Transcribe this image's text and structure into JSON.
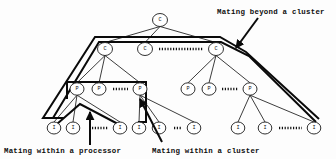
{
  "figure": {
    "width": 336,
    "height": 159,
    "background": "#fdfdfd",
    "line_color": "#1a1a1a",
    "thick_line_color": "#0a0a0a"
  },
  "annotations": {
    "beyond_cluster": "Mating beyond a cluster",
    "within_processor": "Mating within a processor",
    "within_cluster": "Mating within a cluster"
  },
  "node_labels": {
    "cluster": "C",
    "processor": "P",
    "individual": "I"
  },
  "nodes": [
    {
      "id": "root",
      "label": "C",
      "x": 160,
      "y": 20,
      "rx": 7.5,
      "ry": 6.5,
      "level": "root"
    },
    {
      "id": "c1",
      "label": "C",
      "x": 105,
      "y": 49,
      "rx": 7.5,
      "ry": 6.5,
      "level": "cluster"
    },
    {
      "id": "c2",
      "label": "C",
      "x": 145,
      "y": 49,
      "rx": 7.5,
      "ry": 6.5,
      "level": "cluster"
    },
    {
      "id": "c3",
      "label": "C",
      "x": 216,
      "y": 49,
      "rx": 7.5,
      "ry": 6.5,
      "level": "cluster"
    },
    {
      "id": "p1",
      "label": "P",
      "x": 77,
      "y": 89,
      "rx": 7.0,
      "ry": 6.2,
      "level": "processor"
    },
    {
      "id": "p2",
      "label": "P",
      "x": 99,
      "y": 89,
      "rx": 7.0,
      "ry": 6.2,
      "level": "processor"
    },
    {
      "id": "p3",
      "label": "P",
      "x": 140,
      "y": 89,
      "rx": 7.0,
      "ry": 6.2,
      "level": "processor"
    },
    {
      "id": "p4",
      "label": "P",
      "x": 188,
      "y": 89,
      "rx": 7.0,
      "ry": 6.2,
      "level": "processor"
    },
    {
      "id": "p5",
      "label": "P",
      "x": 209,
      "y": 89,
      "rx": 7.0,
      "ry": 6.2,
      "level": "processor"
    },
    {
      "id": "p6",
      "label": "P",
      "x": 250,
      "y": 89,
      "rx": 7.0,
      "ry": 6.2,
      "level": "processor"
    },
    {
      "id": "i1",
      "label": "I",
      "x": 54,
      "y": 128,
      "rx": 6.8,
      "ry": 6.0,
      "level": "individual"
    },
    {
      "id": "i2",
      "label": "I",
      "x": 73,
      "y": 128,
      "rx": 6.8,
      "ry": 6.0,
      "level": "individual"
    },
    {
      "id": "i3",
      "label": "I",
      "x": 120,
      "y": 128,
      "rx": 6.8,
      "ry": 6.0,
      "level": "individual"
    },
    {
      "id": "i4",
      "label": "I",
      "x": 139,
      "y": 128,
      "rx": 6.8,
      "ry": 6.0,
      "level": "individual"
    },
    {
      "id": "i5",
      "label": "I",
      "x": 159,
      "y": 128,
      "rx": 6.8,
      "ry": 6.0,
      "level": "individual"
    },
    {
      "id": "i6",
      "label": "I",
      "x": 194,
      "y": 128,
      "rx": 6.8,
      "ry": 6.0,
      "level": "individual"
    },
    {
      "id": "i7",
      "label": "I",
      "x": 238,
      "y": 128,
      "rx": 6.8,
      "ry": 6.0,
      "level": "individual"
    },
    {
      "id": "i8",
      "label": "I",
      "x": 265,
      "y": 128,
      "rx": 6.8,
      "ry": 6.0,
      "level": "individual"
    },
    {
      "id": "i9",
      "label": "I",
      "x": 314,
      "y": 128,
      "rx": 6.8,
      "ry": 6.0,
      "level": "individual"
    }
  ],
  "edges": [
    {
      "from": "root",
      "to": "c1"
    },
    {
      "from": "root",
      "to": "c2"
    },
    {
      "from": "root",
      "to": "c3"
    },
    {
      "from": "c1",
      "to": "p1"
    },
    {
      "from": "c1",
      "to": "p2"
    },
    {
      "from": "c1",
      "to": "p3"
    },
    {
      "from": "c3",
      "to": "p4"
    },
    {
      "from": "c3",
      "to": "p5"
    },
    {
      "from": "c3",
      "to": "p6"
    },
    {
      "from": "p1",
      "to": "i1"
    },
    {
      "from": "p1",
      "to": "i2"
    },
    {
      "from": "p1",
      "to": "i3"
    },
    {
      "from": "p3",
      "to": "i4"
    },
    {
      "from": "p3",
      "to": "i5"
    },
    {
      "from": "p3",
      "to": "i6"
    },
    {
      "from": "p6",
      "to": "i7"
    },
    {
      "from": "p6",
      "to": "i8"
    },
    {
      "from": "p6",
      "to": "i9"
    }
  ],
  "ellipsis_marks": [
    {
      "id": "cluster-row-dots",
      "x1": 159,
      "x2": 203,
      "y": 49
    },
    {
      "id": "processor-left-dots",
      "x1": 113,
      "x2": 128,
      "y": 89
    },
    {
      "id": "processor-right-dots",
      "x1": 222,
      "x2": 238,
      "y": 89
    },
    {
      "id": "individual-left-dots",
      "x1": 92,
      "x2": 108,
      "y": 128
    },
    {
      "id": "individual-mid-dots",
      "x1": 174,
      "x2": 182,
      "y": 128
    },
    {
      "id": "individual-right-dots",
      "x1": 279,
      "x2": 302,
      "y": 128
    }
  ],
  "regions": {
    "beyond_cluster_path": "M 57,118 L 43,118 L 95,37 L 220,37 L 246,52 L 319,119",
    "beyond_cluster_path_inner": "M 64,118 L 53,118 L 99,42 L 221,42 L 249,56 L 316,122",
    "within_cluster_rect": "M 67,82 L 146,82 L 146,122 L 138,122",
    "within_cluster_stub": "M 67,82 L 67,99",
    "within_processor_tent": "M 57,124 L 80,104 L 118,124"
  },
  "arrows": {
    "beyond_cluster_arrow": {
      "x1": 258,
      "y1": 18,
      "x2": 236,
      "y2": 48
    },
    "within_processor_arrow": {
      "x1": 90,
      "y1": 145,
      "x2": 90,
      "y2": 112
    },
    "within_cluster_arrow": {
      "x1": 162,
      "y1": 142,
      "x2": 140,
      "y2": 99
    }
  },
  "caption_positions": {
    "beyond_cluster": {
      "x": 217,
      "y": 14
    },
    "within_processor": {
      "x": 4,
      "y": 153
    },
    "within_cluster": {
      "x": 152,
      "y": 153
    }
  }
}
